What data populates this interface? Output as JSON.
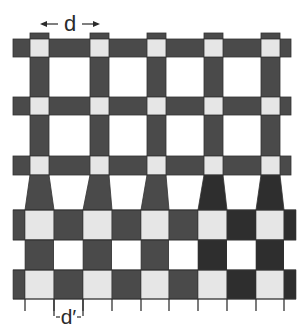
{
  "figure": {
    "labels": {
      "top_period": "d",
      "bottom_period": "d′"
    },
    "colors": {
      "dark": "#4a4a4a",
      "dark_right": "#2e2e2e",
      "light_cell": "#e6e6e6",
      "background": "#ffffff",
      "stroke": "#333333"
    },
    "top_grid": {
      "columns_x": [
        30,
        90,
        147,
        204,
        261
      ],
      "column_width": 19,
      "column_top_y": 33,
      "column_bottom_y": 175,
      "bands_y": [
        [
          39,
          57
        ],
        [
          97,
          115
        ],
        [
          156,
          175
        ]
      ],
      "band_x_range": [
        13,
        291
      ]
    },
    "tapers": {
      "top_y": 175,
      "bottom_y": 210,
      "bottom_x_ranges": [
        [
          25,
          54
        ],
        [
          83,
          112
        ],
        [
          141,
          169
        ],
        [
          198,
          227
        ],
        [
          256,
          284
        ]
      ]
    },
    "checkerboard": {
      "x_edges": [
        13,
        25,
        54,
        83,
        112,
        141,
        169,
        198,
        227,
        256,
        284,
        296
      ],
      "y_edges": [
        210,
        240,
        270,
        299
      ],
      "rows": [
        [
          "dark",
          "light",
          "dark",
          "light",
          "dark",
          "light",
          "dark",
          "light",
          "dark",
          "light",
          "dark"
        ],
        [
          "blank",
          "dark",
          "blank",
          "dark",
          "blank",
          "dark",
          "blank",
          "dark",
          "blank",
          "dark",
          "blank"
        ],
        [
          "dark",
          "light",
          "dark",
          "light",
          "dark",
          "light",
          "dark",
          "light",
          "dark",
          "light",
          "dark"
        ]
      ]
    },
    "ticks": {
      "x": [
        25,
        54,
        83,
        112,
        141,
        169,
        198,
        227,
        256,
        284
      ],
      "top_y": 299,
      "bottom_y": 311
    }
  }
}
